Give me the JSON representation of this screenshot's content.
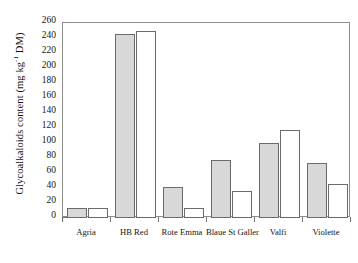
{
  "chart_data": {
    "type": "bar",
    "title": "",
    "xlabel": "",
    "ylabel": "Glycoalkaloids content (mg kg-1 DM)",
    "ylabel_parts": {
      "pre": "Glycoalkaloids content (mg kg",
      "sup": "-1",
      "post": " DM)"
    },
    "categories": [
      "Agria",
      "HB Red",
      "Rote Emma",
      "Blaue St Galler",
      "Valfi",
      "Violette"
    ],
    "series": [
      {
        "name": "series-1-filled",
        "style": "filled",
        "values": [
          13,
          246,
          42,
          78,
          100,
          73
        ]
      },
      {
        "name": "series-2-open",
        "style": "open",
        "values": [
          14,
          249,
          13,
          36,
          117,
          46
        ]
      }
    ],
    "ylim": [
      0,
      260
    ],
    "yticks": [
      0,
      20,
      40,
      60,
      80,
      100,
      120,
      140,
      160,
      180,
      200,
      220,
      240,
      260
    ],
    "ytick_labels": [
      "0",
      "20",
      "40",
      "60",
      "80",
      "100",
      "120",
      "140",
      "160",
      "180",
      "200",
      "220",
      "240",
      "260"
    ],
    "grid": false,
    "legend": "none",
    "colors": {
      "filled": "#d8d8d8",
      "open": "#ffffff",
      "outline": "#6b6b6b",
      "axis": "#8d8d8d"
    }
  }
}
